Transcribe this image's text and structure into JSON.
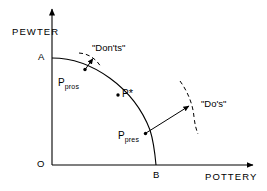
{
  "figure": {
    "type": "production-possibility-frontier-diagram",
    "background_color": "#ffffff",
    "line_color": "#000000"
  },
  "axes": {
    "y_title": "PEWTER",
    "x_title": "POTTERY",
    "origin_label": "O",
    "y_intercept_label": "A",
    "x_intercept_label": "B"
  },
  "curve": {
    "name": "production-possibility-frontier",
    "from_label": "A",
    "to_label": "B"
  },
  "points": {
    "prospective": {
      "label": "P",
      "subscript": "pros"
    },
    "optimum": {
      "label": "P",
      "star": "*"
    },
    "present": {
      "label": "P",
      "subscript": "pres"
    }
  },
  "annotations": {
    "donts": "\"Don'ts\"",
    "dos": "\"Do's\""
  }
}
